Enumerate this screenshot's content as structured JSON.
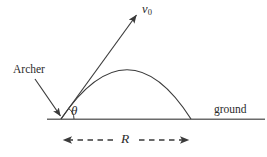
{
  "figure": {
    "type": "physics-diagram",
    "background_color": "#ffffff",
    "stroke_color": "#3a3a3a",
    "ground_line_color": "#6b6b6b",
    "labels": {
      "archer": "Archer",
      "ground": "ground",
      "initial_velocity": "v",
      "initial_velocity_subscript": "0",
      "angle": "θ",
      "range": "R"
    },
    "geometry": {
      "origin": {
        "x": 61,
        "y": 119
      },
      "ground_line": {
        "x1": 47,
        "y1": 119,
        "x2": 265,
        "y2": 119
      },
      "velocity_arrow": {
        "x1": 61,
        "y1": 119,
        "x2": 138,
        "y2": 13
      },
      "trajectory": {
        "start": {
          "x": 61,
          "y": 119
        },
        "apex": {
          "x": 128,
          "y": 70
        },
        "end": {
          "x": 191,
          "y": 119
        }
      },
      "angle_arc_radius": 13,
      "archer_pointer": {
        "x1": 35,
        "y1": 79,
        "x2": 62,
        "y2": 116
      },
      "range_dimension": {
        "x1": 61,
        "x2": 191,
        "y": 140
      }
    }
  }
}
